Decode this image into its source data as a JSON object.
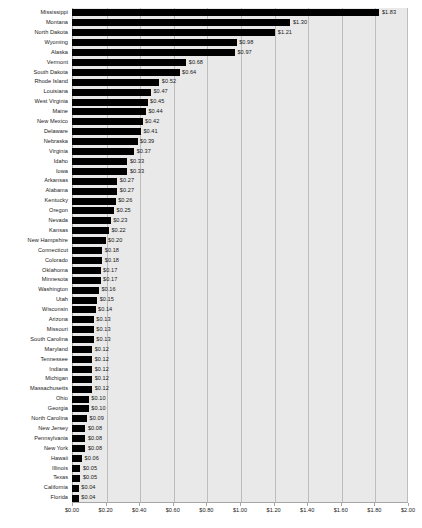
{
  "chart_data": {
    "type": "bar",
    "orientation": "horizontal",
    "title": "",
    "subtitle": "",
    "xlabel": "",
    "ylabel": "",
    "xlim": [
      0,
      2.0
    ],
    "xticks": [
      "$0.00",
      "$0.20",
      "$0.40",
      "$0.60",
      "$0.80",
      "$1.00",
      "$1.20",
      "$1.40",
      "$1.60",
      "$1.80",
      "$2.00"
    ],
    "xtick_values": [
      0,
      0.2,
      0.4,
      0.6,
      0.8,
      1.0,
      1.2,
      1.4,
      1.6,
      1.8,
      2.0
    ],
    "grid": true,
    "grid_axis": "x",
    "legend": false,
    "legend_position": "none",
    "value_prefix": "$",
    "sorted": "descending",
    "categories": [
      "Mississippi",
      "Montana",
      "North Dakota",
      "Wyoming",
      "Alaska",
      "Vermont",
      "South Dakota",
      "Rhode Island",
      "Louisiana",
      "West Virginia",
      "Maine",
      "New Mexico",
      "Delaware",
      "Nebraska",
      "Virginia",
      "Idaho",
      "Iowa",
      "Arkansas",
      "Alabama",
      "Kentucky",
      "Oregon",
      "Nevada",
      "Kansas",
      "New Hampshire",
      "Connecticut",
      "Colorado",
      "Oklahoma",
      "Minnesota",
      "Washington",
      "Utah",
      "Wisconsin",
      "Arizona",
      "Missouri",
      "South Carolina",
      "Maryland",
      "Tennessee",
      "Indiana",
      "Michigan",
      "Massachusetts",
      "Ohio",
      "Georgia",
      "North Carolina",
      "New Jersey",
      "Pennsylvania",
      "New York",
      "Hawaii",
      "Illinois",
      "Texas",
      "California",
      "Florida"
    ],
    "values": [
      1.83,
      1.3,
      1.21,
      0.98,
      0.97,
      0.68,
      0.64,
      0.52,
      0.47,
      0.45,
      0.44,
      0.42,
      0.41,
      0.39,
      0.37,
      0.33,
      0.33,
      0.27,
      0.27,
      0.26,
      0.25,
      0.23,
      0.22,
      0.2,
      0.18,
      0.18,
      0.17,
      0.17,
      0.16,
      0.15,
      0.14,
      0.13,
      0.13,
      0.13,
      0.12,
      0.12,
      0.12,
      0.12,
      0.12,
      0.1,
      0.1,
      0.09,
      0.08,
      0.08,
      0.08,
      0.06,
      0.05,
      0.05,
      0.04,
      0.04
    ],
    "value_labels": [
      "$1.83",
      "$1.30",
      "$1.21",
      "$0.98",
      "$0.97",
      "$0.68",
      "$0.64",
      "$0.52",
      "$0.47",
      "$0.45",
      "$0.44",
      "$0.42",
      "$0.41",
      "$0.39",
      "$0.37",
      "$0.33",
      "$0.33",
      "$0.27",
      "$0.27",
      "$0.26",
      "$0.25",
      "$0.23",
      "$0.22",
      "$0.20",
      "$0.18",
      "$0.18",
      "$0.17",
      "$0.17",
      "$0.16",
      "$0.15",
      "$0.14",
      "$0.13",
      "$0.13",
      "$0.13",
      "$0.12",
      "$0.12",
      "$0.12",
      "$0.12",
      "$0.12",
      "$0.10",
      "$0.10",
      "$0.09",
      "$0.08",
      "$0.08",
      "$0.08",
      "$0.06",
      "$0.05",
      "$0.05",
      "$0.04",
      "$0.04"
    ],
    "colors": {
      "bar": "#000000",
      "plot_background": "#e9e9e9",
      "gridline": "#bdbdbd",
      "axis": "#a6a6a6",
      "text": "#1a1a1a",
      "page_background": "#ffffff"
    }
  }
}
